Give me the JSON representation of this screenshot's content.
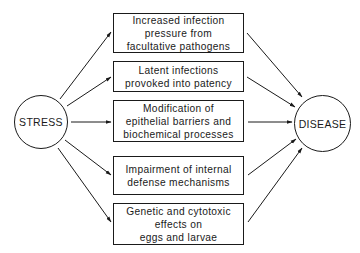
{
  "diagram": {
    "source_node": {
      "label": "STRESS"
    },
    "target_node": {
      "label": "DISEASE"
    },
    "factors": [
      {
        "label": "Increased infection\npressure from\nfacultative pathogens"
      },
      {
        "label": "Latent infections\nprovoked into patency"
      },
      {
        "label": "Modification of\nepithelial barriers and\nbiochemical processes"
      },
      {
        "label": "Impairment of internal\ndefense mechanisms"
      },
      {
        "label": "Genetic and cytotoxic\neffects on\neggs and larvae"
      }
    ],
    "edges": [
      {
        "from": "STRESS",
        "to": "factor-1"
      },
      {
        "from": "STRESS",
        "to": "factor-2"
      },
      {
        "from": "STRESS",
        "to": "factor-3"
      },
      {
        "from": "STRESS",
        "to": "factor-4"
      },
      {
        "from": "STRESS",
        "to": "factor-5"
      },
      {
        "from": "factor-1",
        "to": "DISEASE"
      },
      {
        "from": "factor-2",
        "to": "DISEASE"
      },
      {
        "from": "factor-3",
        "to": "DISEASE"
      },
      {
        "from": "factor-4",
        "to": "DISEASE"
      },
      {
        "from": "factor-5",
        "to": "DISEASE"
      }
    ],
    "colors": {
      "line": "#1a1a1a",
      "background": "#ffffff"
    }
  }
}
